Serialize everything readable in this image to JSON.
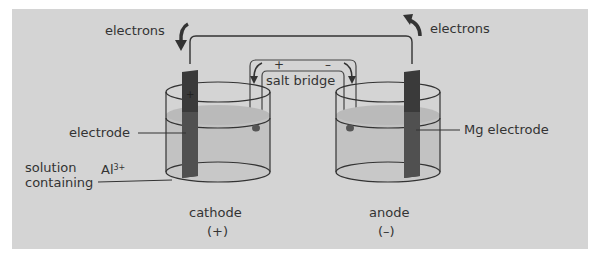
{
  "diagram": {
    "type": "galvanic-cell",
    "background_color": "#d4d4d4",
    "labels": {
      "electrons_left": "electrons",
      "electrons_right": "electrons",
      "salt_bridge": "salt bridge",
      "salt_bridge_plus": "+",
      "salt_bridge_minus": "–",
      "electrode": "electrode",
      "mg_electrode": "Mg electrode",
      "solution_line1": "solution",
      "solution_line2": "containing",
      "ion": "Al",
      "ion_charge": "3+",
      "cathode": "cathode",
      "cathode_sign": "(+)",
      "anode": "anode",
      "anode_sign": "(–)",
      "electrode_plus_mark": "+"
    },
    "colors": {
      "electrode": "#3a3a3a",
      "solution": "#bdbdbd",
      "line": "#333333",
      "text": "#333333"
    }
  }
}
